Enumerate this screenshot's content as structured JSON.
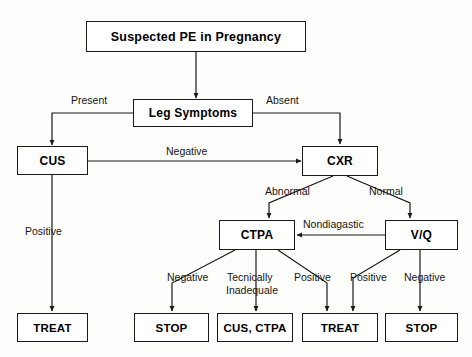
{
  "diagram": {
    "title_node": "Suspected PE in Pregnancy",
    "nodes": [
      {
        "id": "suspected",
        "label": "Suspected PE in Pregnancy"
      },
      {
        "id": "leg_symptoms",
        "label": "Leg Symptoms"
      },
      {
        "id": "cus",
        "label": "CUS"
      },
      {
        "id": "cxr",
        "label": "CXR"
      },
      {
        "id": "ctpa",
        "label": "CTPA"
      },
      {
        "id": "vq",
        "label": "V/Q"
      },
      {
        "id": "treat_left",
        "label": "TREAT"
      },
      {
        "id": "stop_1",
        "label": "STOP"
      },
      {
        "id": "cus_ctpa",
        "label": "CUS, CTPA"
      },
      {
        "id": "treat_right",
        "label": "TREAT"
      },
      {
        "id": "stop_2",
        "label": "STOP"
      }
    ],
    "edge_labels": {
      "present": "Present",
      "absent": "Absent",
      "negative_cus_to_cxr": "Negative",
      "positive_cus": "Positive",
      "abnormal": "Abnormal",
      "normal": "Normal",
      "nondiagnostic": "Nondiagastic",
      "ctpa_negative": "Negative",
      "ctpa_inadequate_line1": "Tecnically",
      "ctpa_inadequate_line2": "Inadequale",
      "ctpa_positive": "Positive",
      "vq_positive": "Positive",
      "vq_negative": "Negative"
    },
    "colors": {
      "line": "#1a1a1a",
      "box_border": "#1a1a1a",
      "box_fill": "#ffffff",
      "text": "#000000",
      "background": "#fdfdfc"
    }
  }
}
